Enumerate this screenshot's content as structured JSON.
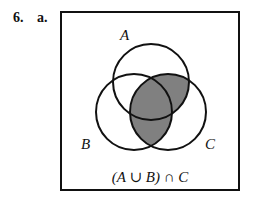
{
  "problem": {
    "number": "6.",
    "part": "a."
  },
  "diagram": {
    "labels": {
      "A": "A",
      "B": "B",
      "C": "C"
    },
    "expression": "(A ∪ B) ∩ C",
    "shade_color": "#808080"
  }
}
